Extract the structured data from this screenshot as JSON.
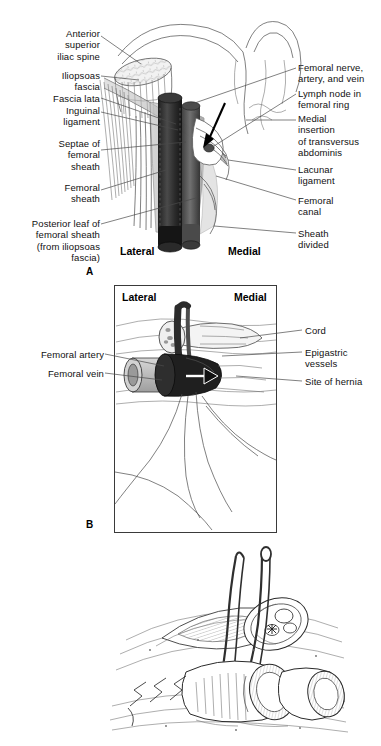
{
  "figure": {
    "background_color": "#ffffff",
    "ink_color": "#4a4a4a",
    "line_art_color": "#2a2a2a"
  },
  "panels": [
    {
      "letter": "A",
      "orientation_left": "Lateral",
      "orientation_right": "Medial",
      "has_box": false,
      "labels_left": [
        {
          "id": "anterior-superior-iliac-spine",
          "text": "Anterior\nsuperior\niliac spine"
        },
        {
          "id": "iliopsoas-fascia",
          "text": "Iliopsoas\nfascia"
        },
        {
          "id": "fascia-lata",
          "text": "Fascia lata"
        },
        {
          "id": "inguinal-ligament",
          "text": "Inguinal\nligament"
        },
        {
          "id": "septae-of-femoral-sheath",
          "text": "Septae of\nfemoral\nsheath"
        },
        {
          "id": "femoral-sheath",
          "text": "Femoral\nsheath"
        },
        {
          "id": "posterior-leaf-of-femoral-sheath",
          "text": "Posterior leaf of\nfemoral sheath\n(from iliopsoas\nfascia)"
        }
      ],
      "labels_right": [
        {
          "id": "femoral-nerve-artery-vein",
          "text": "Femoral nerve,\nartery, and vein"
        },
        {
          "id": "lymph-node-in-femoral-ring",
          "text": "Lymph node in\nfemoral ring"
        },
        {
          "id": "medial-insertion-of-transversus-abdominis",
          "text": "Medial\ninsertion\nof transversus\nabdominis"
        },
        {
          "id": "lacunar-ligament",
          "text": "Lacunar\nligament"
        },
        {
          "id": "femoral-canal",
          "text": "Femoral\ncanal"
        },
        {
          "id": "sheath-divided",
          "text": "Sheath\ndivided"
        }
      ]
    },
    {
      "letter": "B",
      "orientation_left": "Lateral",
      "orientation_right": "Medial",
      "has_box": true,
      "labels_left": [
        {
          "id": "femoral-artery",
          "text": "Femoral artery"
        },
        {
          "id": "femoral-vein",
          "text": "Femoral vein"
        }
      ],
      "labels_right": [
        {
          "id": "cord",
          "text": "Cord"
        },
        {
          "id": "epigastric-vessels",
          "text": "Epigastric\nvessels"
        },
        {
          "id": "site-of-hernia",
          "text": "Site of hernia"
        }
      ]
    },
    {
      "letter": "",
      "orientation_left": "",
      "orientation_right": "",
      "has_box": false,
      "labels_left": [],
      "labels_right": []
    }
  ]
}
